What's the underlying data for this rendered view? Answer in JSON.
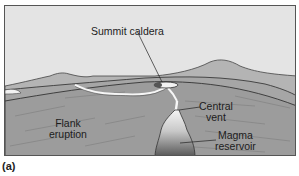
{
  "figure": {
    "caption": "(a)",
    "labels": {
      "summit_caldera": "Summit caldera",
      "flank_eruption_line1": "Flank",
      "flank_eruption_line2": "eruption",
      "central_vent_line1": "Central",
      "central_vent_line2": "vent",
      "magma_reservoir_line1": "Magma",
      "magma_reservoir_line2": "reservoir"
    },
    "colors": {
      "sky": "#e3e3e3",
      "ground": "#a8a8a8",
      "ground_dark": "#8f8f8f",
      "magma_light": "#f0f0f0",
      "magma_dark": "#5a5a5a",
      "outline": "#333333"
    }
  }
}
